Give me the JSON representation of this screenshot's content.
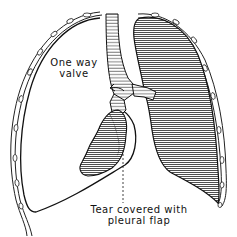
{
  "diagram": {
    "type": "anatomical-illustration",
    "labels": {
      "valve_line1": "One way",
      "valve_line2": "valve",
      "tear_line1": "Tear covered with",
      "tear_line2": "pleural flap"
    },
    "colors": {
      "ink": "#111111",
      "background": "#ffffff"
    }
  }
}
